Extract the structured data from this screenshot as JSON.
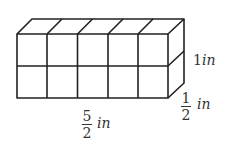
{
  "diagram": {
    "type": "rectangular-prism-of-unit-cubes",
    "columns": 5,
    "rows": 2,
    "depth_layers": 1,
    "stroke_color": "#222222",
    "labels": {
      "height": {
        "value": "1",
        "unit": "in"
      },
      "depth": {
        "numerator": "1",
        "denominator": "2",
        "unit": "in"
      },
      "length": {
        "numerator": "5",
        "denominator": "2",
        "unit": "in"
      }
    }
  }
}
